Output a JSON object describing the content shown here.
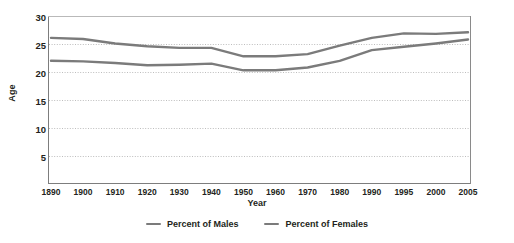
{
  "chart_data": {
    "type": "line",
    "title": "",
    "xlabel": "Year",
    "ylabel": "Age",
    "grid": true,
    "legend_position": "bottom-center",
    "xlim": [
      1890,
      2005
    ],
    "ylim": [
      0,
      30
    ],
    "yticks": [
      30,
      25,
      20,
      15,
      10,
      5
    ],
    "x": [
      1890,
      1900,
      1910,
      1920,
      1930,
      1940,
      1950,
      1960,
      1970,
      1980,
      1990,
      1995,
      2000,
      2005
    ],
    "categories": [
      "1890",
      "1900",
      "1910",
      "1920",
      "1930",
      "1940",
      "1950",
      "1960",
      "1970",
      "1980",
      "1990",
      "1995",
      "2000",
      "2005"
    ],
    "series": [
      {
        "name": "Percent of Males",
        "color": "#7b7b7b",
        "values": [
          26.1,
          25.9,
          25.1,
          24.6,
          24.3,
          24.3,
          22.8,
          22.8,
          23.2,
          24.7,
          26.1,
          26.9,
          26.8,
          27.1
        ]
      },
      {
        "name": "Percent of Females",
        "color": "#7b7b7b",
        "values": [
          22.0,
          21.9,
          21.6,
          21.2,
          21.3,
          21.5,
          20.3,
          20.3,
          20.8,
          22.0,
          23.9,
          24.5,
          25.1,
          25.8
        ]
      }
    ]
  },
  "axes": {
    "ylabel": "Age",
    "xlabel": "Year",
    "ytick_labels": [
      "30",
      "25",
      "20",
      "15",
      "10",
      "5"
    ],
    "xtick_labels": [
      "1890",
      "1900",
      "1910",
      "1920",
      "1930",
      "1940",
      "1950",
      "1960",
      "1970",
      "1980",
      "1990",
      "1995",
      "2000",
      "2005"
    ]
  },
  "legend": {
    "items": [
      {
        "label": "Percent of Males",
        "color": "#7b7b7b"
      },
      {
        "label": "Percent of Females",
        "color": "#7b7b7b"
      }
    ]
  },
  "style": {
    "line_color": "#7b7b7b",
    "axis_color": "#7d7d7d",
    "grid_color": "#bdbdbd",
    "text_color": "#231f20",
    "background": "#ffffff"
  }
}
